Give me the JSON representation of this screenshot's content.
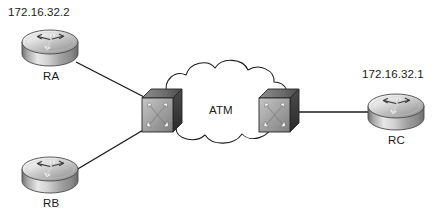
{
  "diagram": {
    "background_color": "#ffffff",
    "line_color": "#1a1a1a",
    "cloud": {
      "label": "ATM",
      "name": "atm-cloud",
      "outline_color": "#1a1a1a",
      "fill_color": "#ffffff"
    },
    "routers": [
      {
        "id": "RA",
        "label": "RA",
        "ip": "172.16.32.2",
        "icon": "router-icon",
        "x": 20,
        "y": 28,
        "w": 60,
        "h": 40,
        "label_x": 43,
        "label_y": 70,
        "ip_x": 8,
        "ip_y": 6
      },
      {
        "id": "RB",
        "label": "RB",
        "ip": "",
        "icon": "router-icon",
        "x": 20,
        "y": 155,
        "w": 60,
        "h": 40,
        "label_x": 43,
        "label_y": 197,
        "ip_x": 0,
        "ip_y": 0
      },
      {
        "id": "RC",
        "label": "RC",
        "ip": "172.16.32.1",
        "icon": "router-icon",
        "x": 366,
        "y": 92,
        "w": 60,
        "h": 40,
        "label_x": 388,
        "label_y": 134,
        "ip_x": 362,
        "ip_y": 68
      }
    ],
    "switches": [
      {
        "id": "SW1",
        "label": "",
        "icon": "atm-switch-icon",
        "x": 141,
        "y": 88,
        "w": 42,
        "h": 46
      },
      {
        "id": "SW2",
        "label": "",
        "icon": "atm-switch-icon",
        "x": 258,
        "y": 88,
        "w": 42,
        "h": 46
      }
    ],
    "links": [
      {
        "name": "link-ra-sw1",
        "from": "RA",
        "to": "SW1"
      },
      {
        "name": "link-rb-sw1",
        "from": "RB",
        "to": "SW1"
      },
      {
        "name": "link-sw2-rc",
        "from": "SW2",
        "to": "RC"
      }
    ],
    "colors": {
      "router_top_light": "#f2f2f2",
      "router_top_dark": "#9a9a9a",
      "router_body_light": "#d8d8d8",
      "router_body_dark": "#7d7d7d",
      "switch_front_light": "#b5b5b5",
      "switch_front_dark": "#868686",
      "switch_side": "#3f3f3f",
      "switch_top": "#6e6e6e",
      "arrow_white": "#ffffff",
      "stroke": "#1a1a1a"
    }
  }
}
